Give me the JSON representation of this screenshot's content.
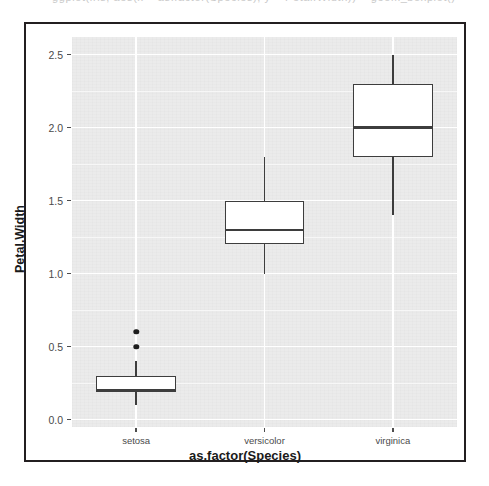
{
  "ghost": {
    "clipped_top_line": "ggplot(iris, aes(x = as.factor(Species), y = Petal.Width)) + geom_boxplot()"
  },
  "chart_data": {
    "type": "box",
    "title": "",
    "subtitle": "",
    "xlabel": "as.factor(Species)",
    "ylabel": "Petal.Width",
    "categories": [
      "setosa",
      "versicolor",
      "virginica"
    ],
    "ylim": [
      -0.05,
      2.62
    ],
    "y_ticks": [
      "0.0",
      "0.5",
      "1.0",
      "1.5",
      "2.0",
      "2.5"
    ],
    "y_tick_values": [
      0.0,
      0.5,
      1.0,
      1.5,
      2.0,
      2.5
    ],
    "y_minor_ticks": [
      0.25,
      0.75,
      1.25,
      1.75,
      2.25
    ],
    "grid": true,
    "legend": "none",
    "theme": "ggplot2 theme_gray",
    "panel_fill": "#ebebeb",
    "gridline_color": "#ffffff",
    "box_fill": "#ffffff",
    "box_stroke": "#3d3d3d",
    "outlier_color": "#1d1d1d",
    "boxes": [
      {
        "category": "setosa",
        "min_whisker": 0.1,
        "q1": 0.2,
        "median": 0.2,
        "q3": 0.3,
        "max_whisker": 0.4,
        "outliers": [
          0.5,
          0.6
        ]
      },
      {
        "category": "versicolor",
        "min_whisker": 1.0,
        "q1": 1.2,
        "median": 1.3,
        "q3": 1.5,
        "max_whisker": 1.8,
        "outliers": []
      },
      {
        "category": "virginica",
        "min_whisker": 1.4,
        "q1": 1.8,
        "median": 2.0,
        "q3": 2.3,
        "max_whisker": 2.5,
        "outliers": []
      }
    ]
  }
}
